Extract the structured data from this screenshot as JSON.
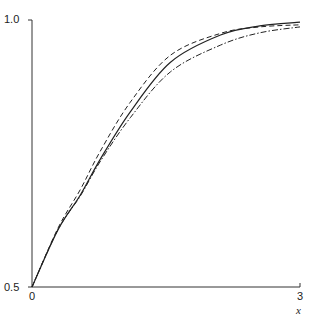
{
  "chart_data": {
    "type": "line",
    "title": "",
    "xlabel": "x",
    "ylabel": "",
    "xlim": [
      0,
      3
    ],
    "ylim": [
      0.5,
      1.0
    ],
    "grid": false,
    "legend": null,
    "x_ticks": [
      "0",
      "3"
    ],
    "y_ticks": [
      "0.5",
      "1.0"
    ],
    "x": [
      0,
      0.29,
      0.54,
      0.76,
      1.1,
      1.55,
      2.11,
      2.55,
      3.0
    ],
    "series": [
      {
        "name": "solid",
        "style": "solid",
        "values": [
          0.5,
          0.607,
          0.672,
          0.738,
          0.828,
          0.921,
          0.972,
          0.989,
          0.996
        ]
      },
      {
        "name": "dashed",
        "style": "dashed",
        "values": [
          0.5,
          0.61,
          0.682,
          0.753,
          0.846,
          0.934,
          0.975,
          0.987,
          0.991
        ]
      },
      {
        "name": "dash-dot",
        "style": "dashdot",
        "values": [
          0.5,
          0.607,
          0.67,
          0.734,
          0.817,
          0.903,
          0.953,
          0.976,
          0.987
        ]
      }
    ]
  },
  "labels": {
    "y_top": "1.0",
    "y_bottom": "0.5",
    "x_left": "0",
    "x_right": "3",
    "x_axis": "x"
  }
}
